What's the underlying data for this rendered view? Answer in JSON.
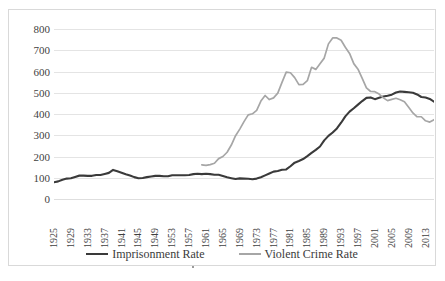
{
  "chart_data": {
    "type": "line",
    "title": "",
    "subtitle": "",
    "xlabel": "",
    "ylabel": "",
    "xlim": [
      1925,
      2015
    ],
    "ylim": [
      0,
      800
    ],
    "y_ticks": [
      800,
      700,
      600,
      500,
      400,
      300,
      200,
      100,
      0
    ],
    "x_ticks": [
      1925,
      1929,
      1933,
      1937,
      1941,
      1945,
      1949,
      1953,
      1957,
      1961,
      1965,
      1969,
      1973,
      1977,
      1981,
      1985,
      1989,
      1993,
      1997,
      2001,
      2005,
      2009,
      2013
    ],
    "grid": "horizontal",
    "legend_position": "bottom",
    "colors": {
      "imprisonment": "#3a3a3a",
      "violent_crime": "#a6a6a6",
      "gridline": "#e4e4e4",
      "border": "#d9d9d9",
      "text": "#3f3f3f"
    },
    "series": [
      {
        "name": "Imprisonment Rate",
        "color": "#3a3a3a",
        "x": [
          1925,
          1926,
          1927,
          1928,
          1929,
          1930,
          1931,
          1932,
          1933,
          1934,
          1935,
          1936,
          1937,
          1938,
          1939,
          1940,
          1941,
          1942,
          1943,
          1944,
          1945,
          1946,
          1947,
          1948,
          1949,
          1950,
          1951,
          1952,
          1953,
          1954,
          1955,
          1956,
          1957,
          1958,
          1959,
          1960,
          1961,
          1962,
          1963,
          1964,
          1965,
          1966,
          1967,
          1968,
          1969,
          1970,
          1971,
          1972,
          1973,
          1974,
          1975,
          1976,
          1977,
          1978,
          1979,
          1980,
          1981,
          1982,
          1983,
          1984,
          1985,
          1986,
          1987,
          1988,
          1989,
          1990,
          1991,
          1992,
          1993,
          1994,
          1995,
          1996,
          1997,
          1998,
          1999,
          2000,
          2001,
          2002,
          2003,
          2004,
          2005,
          2006,
          2007,
          2008,
          2009,
          2010,
          2011,
          2012,
          2013,
          2014,
          2015
        ],
        "values": [
          79,
          83,
          91,
          96,
          98,
          104,
          110,
          110,
          109,
          109,
          113,
          113,
          118,
          123,
          137,
          131,
          124,
          117,
          111,
          103,
          98,
          99,
          103,
          106,
          109,
          109,
          107,
          107,
          112,
          112,
          112,
          112,
          113,
          117,
          119,
          117,
          119,
          117,
          114,
          114,
          108,
          102,
          98,
          94,
          97,
          96,
          95,
          93,
          96,
          102,
          111,
          120,
          129,
          132,
          138,
          139,
          154,
          171,
          179,
          188,
          202,
          217,
          231,
          247,
          276,
          297,
          313,
          332,
          359,
          389,
          411,
          427,
          444,
          461,
          476,
          478,
          470,
          476,
          482,
          486,
          491,
          501,
          506,
          504,
          502,
          500,
          492,
          480,
          478,
          471,
          458
        ],
        "note": "Rate per 100,000 U.S. residents"
      },
      {
        "name": "Violent Crime Rate",
        "color": "#a6a6a6",
        "x": [
          1960,
          1961,
          1962,
          1963,
          1964,
          1965,
          1966,
          1967,
          1968,
          1969,
          1970,
          1971,
          1972,
          1973,
          1974,
          1975,
          1976,
          1977,
          1978,
          1979,
          1980,
          1981,
          1982,
          1983,
          1984,
          1985,
          1986,
          1987,
          1988,
          1989,
          1990,
          1991,
          1992,
          1993,
          1994,
          1995,
          1996,
          1997,
          1998,
          1999,
          2000,
          2001,
          2002,
          2003,
          2004,
          2005,
          2006,
          2007,
          2008,
          2009,
          2010,
          2011,
          2012,
          2013,
          2014,
          2015
        ],
        "values": [
          161,
          158,
          162,
          168,
          190,
          200,
          220,
          254,
          298,
          329,
          364,
          396,
          401,
          417,
          461,
          487,
          468,
          476,
          498,
          549,
          597,
          594,
          571,
          538,
          539,
          557,
          620,
          610,
          637,
          663,
          730,
          758,
          758,
          747,
          714,
          685,
          637,
          611,
          568,
          523,
          506,
          505,
          494,
          476,
          463,
          469,
          474,
          467,
          458,
          432,
          405,
          387,
          387,
          368,
          362,
          373
        ],
        "note": "Rate per 100,000 U.S. residents"
      }
    ]
  },
  "legend": {
    "items": [
      {
        "label": "Imprisonment Rate",
        "color": "#3a3a3a"
      },
      {
        "label": "Violent Crime Rate",
        "color": "#a6a6a6"
      }
    ]
  }
}
